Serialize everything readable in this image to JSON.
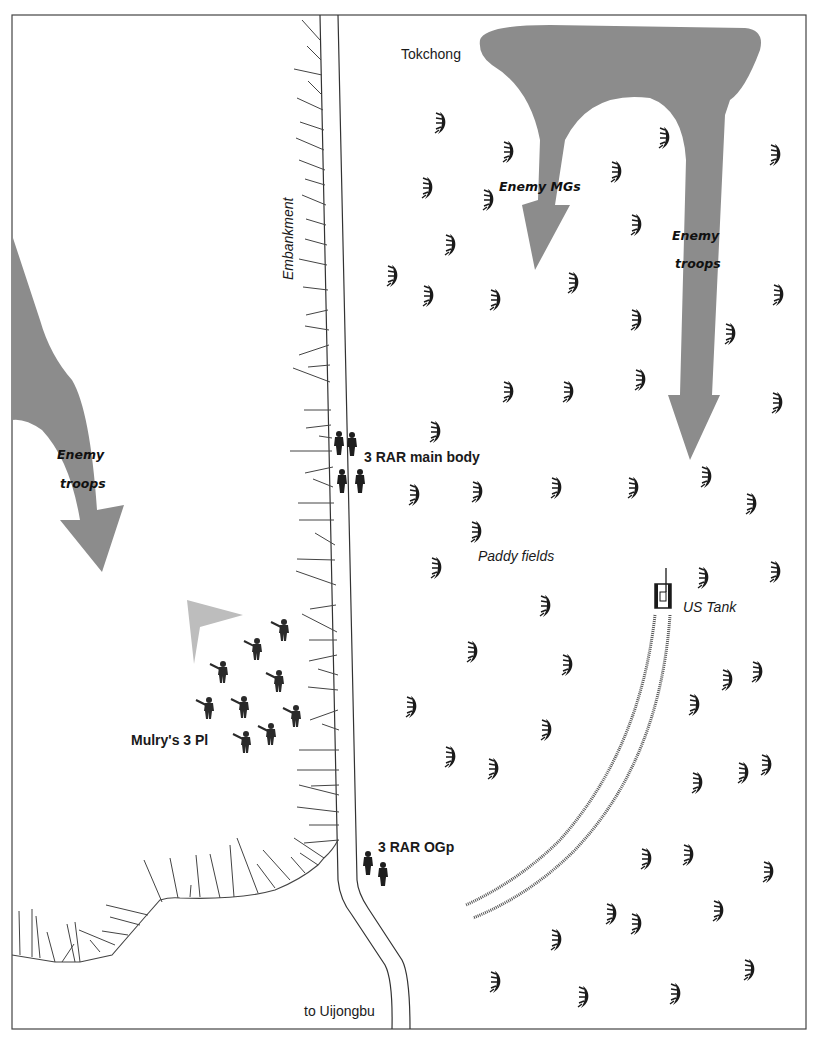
{
  "map": {
    "title": "",
    "labels": {
      "tokchong": "Tokchong",
      "embankment": "Embankment",
      "enemy_mgs": "Enemy MGs",
      "enemy_troops_right_1": "Enemy",
      "enemy_troops_right_2": "troops",
      "enemy_troops_left_1": "Enemy",
      "enemy_troops_left_2": "troops",
      "main_body": "3 RAR main body",
      "paddy_fields": "Paddy fields",
      "us_tank": "US Tank",
      "mulry_platoon": "Mulry's 3 Pl",
      "ogp": "3 RAR OGp",
      "to_uijongbu": "to Uijongbu"
    },
    "colors": {
      "enemy_arrow": "#8c8c8c",
      "friendly_arrow": "#bdbdbd",
      "line": "#333333",
      "figure": "#1e1e1e"
    },
    "icons": {
      "paddy": "paddy-plant-icon",
      "soldier": "soldier-icon",
      "tank": "tank-icon"
    }
  }
}
